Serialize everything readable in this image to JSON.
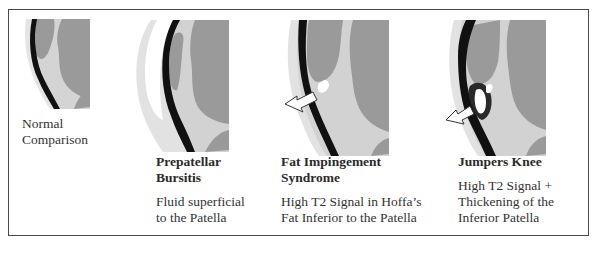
{
  "panels": [
    {
      "id": "normal",
      "title_lines": [
        "",
        ""
      ],
      "description_lines": [
        "Normal",
        "Comparison"
      ],
      "has_arrow": false
    },
    {
      "id": "prepatellar-bursitis",
      "title_lines": [
        "Prepatellar",
        "Bursitis"
      ],
      "description_lines": [
        "Fluid superficial",
        "to the Patella"
      ],
      "has_arrow": false
    },
    {
      "id": "fat-impingement",
      "title_lines": [
        "Fat Impingement",
        "Syndrome"
      ],
      "description_lines": [
        "High T2 Signal in Hoffa’s",
        "Fat Inferior to the Patella"
      ],
      "has_arrow": true
    },
    {
      "id": "jumpers-knee",
      "title_lines": [
        "Jumpers Knee"
      ],
      "description_lines": [
        "High T2 Signal +",
        "Thickening of the",
        "Inferior Patella"
      ],
      "has_arrow": true
    }
  ],
  "colors": {
    "frame": "#4a4a4a",
    "bone": "#9b9b9b",
    "fat": "#d6d6d6",
    "tendon": "#111111",
    "fluid": "#ffffff",
    "skin": "#e6e6e6"
  }
}
